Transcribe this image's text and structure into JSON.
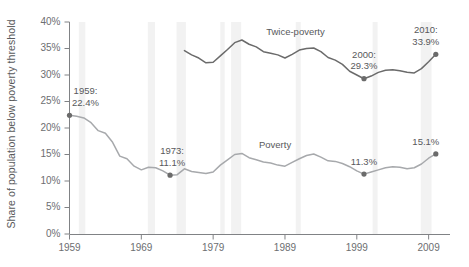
{
  "chart_data": {
    "type": "line",
    "title": "",
    "xlabel": "",
    "ylabel": "Share of population below poverty threshold",
    "xlim": [
      1959,
      2011
    ],
    "ylim": [
      0,
      40
    ],
    "grid": false,
    "legend_position": "inline-labels",
    "y_ticks": [
      "0%",
      "5%",
      "10%",
      "15%",
      "20%",
      "25%",
      "30%",
      "35%",
      "40%"
    ],
    "y_tick_values": [
      0,
      5,
      10,
      15,
      20,
      25,
      30,
      35,
      40
    ],
    "x_ticks": [
      "1959",
      "1969",
      "1979",
      "1989",
      "1999",
      "2009"
    ],
    "x_tick_values": [
      1959,
      1969,
      1979,
      1989,
      1999,
      2009
    ],
    "series": [
      {
        "name": "Twice-poverty",
        "color": "#6b6b6b",
        "x": [
          1975,
          1976,
          1977,
          1978,
          1979,
          1980,
          1981,
          1982,
          1983,
          1984,
          1985,
          1986,
          1987,
          1988,
          1989,
          1990,
          1991,
          1992,
          1993,
          1994,
          1995,
          1996,
          1997,
          1998,
          1999,
          2000,
          2001,
          2002,
          2003,
          2004,
          2005,
          2006,
          2007,
          2008,
          2009,
          2010
        ],
        "values": [
          34.6,
          33.8,
          33.2,
          32.3,
          32.4,
          33.6,
          34.8,
          36.1,
          36.6,
          35.8,
          35.3,
          34.4,
          34.1,
          33.8,
          33.2,
          33.9,
          34.7,
          35.0,
          35.1,
          34.4,
          33.3,
          32.8,
          32.0,
          30.7,
          30.0,
          29.3,
          29.8,
          30.5,
          30.9,
          31.0,
          30.8,
          30.5,
          30.4,
          31.2,
          32.5,
          33.9
        ]
      },
      {
        "name": "Poverty",
        "color": "#a7a9ac",
        "x": [
          1959,
          1960,
          1961,
          1962,
          1963,
          1964,
          1965,
          1966,
          1967,
          1968,
          1969,
          1970,
          1971,
          1972,
          1973,
          1974,
          1975,
          1976,
          1977,
          1978,
          1979,
          1980,
          1981,
          1982,
          1983,
          1984,
          1985,
          1986,
          1987,
          1988,
          1989,
          1990,
          1991,
          1992,
          1993,
          1994,
          1995,
          1996,
          1997,
          1998,
          1999,
          2000,
          2001,
          2002,
          2003,
          2004,
          2005,
          2006,
          2007,
          2008,
          2009,
          2010
        ],
        "values": [
          22.4,
          22.2,
          21.9,
          21.0,
          19.5,
          19.0,
          17.3,
          14.7,
          14.2,
          12.8,
          12.1,
          12.6,
          12.5,
          11.9,
          11.1,
          11.2,
          12.3,
          11.8,
          11.6,
          11.4,
          11.7,
          13.0,
          14.0,
          15.0,
          15.2,
          14.4,
          14.0,
          13.6,
          13.4,
          13.0,
          12.8,
          13.5,
          14.2,
          14.8,
          15.1,
          14.5,
          13.8,
          13.7,
          13.3,
          12.7,
          11.9,
          11.3,
          11.7,
          12.1,
          12.5,
          12.7,
          12.6,
          12.3,
          12.5,
          13.2,
          14.3,
          15.1
        ]
      }
    ],
    "recession_bands": [
      {
        "start": 1960.3,
        "end": 1961.2
      },
      {
        "start": 1969.9,
        "end": 1970.9
      },
      {
        "start": 1973.9,
        "end": 1975.2
      },
      {
        "start": 1980.0,
        "end": 1980.6
      },
      {
        "start": 1981.5,
        "end": 1982.9
      },
      {
        "start": 1990.5,
        "end": 1991.2
      },
      {
        "start": 2001.2,
        "end": 2001.9
      },
      {
        "start": 2007.9,
        "end": 2009.4
      }
    ],
    "recession_band_color": "#f2f2f2",
    "annotations": [
      {
        "id": "a1959",
        "label_line1": "1959:",
        "label_line2": "22.4%",
        "x": 1959,
        "y": 22.4,
        "marker": true,
        "marker_color": "#6b6b6b"
      },
      {
        "id": "a1973",
        "label_line1": "1973:",
        "label_line2": "11.1%",
        "x": 1973,
        "y": 11.1,
        "marker": true,
        "marker_color": "#6b6b6b"
      },
      {
        "id": "a2000",
        "label_line1": "2000:",
        "label_line2": "29.3%",
        "x": 2000,
        "y": 29.3,
        "marker": true,
        "marker_color": "#6b6b6b"
      },
      {
        "id": "a2010t",
        "label_line1": "2010:",
        "label_line2": "33.9%",
        "x": 2010,
        "y": 33.9,
        "marker": true,
        "marker_color": "#6b6b6b"
      },
      {
        "id": "a2000p",
        "label_line1": "",
        "label_line2": "11.3%",
        "x": 2000,
        "y": 11.3,
        "marker": true,
        "marker_color": "#6b6b6b"
      },
      {
        "id": "a2010p",
        "label_line1": "",
        "label_line2": "15.1%",
        "x": 2010,
        "y": 15.1,
        "marker": true,
        "marker_color": "#6b6b6b"
      }
    ],
    "inline_series_labels": [
      {
        "name": "Twice-poverty",
        "x": 1990,
        "y": 38.0
      },
      {
        "name": "Poverty",
        "x": 1989,
        "y": 16.6
      }
    ]
  }
}
